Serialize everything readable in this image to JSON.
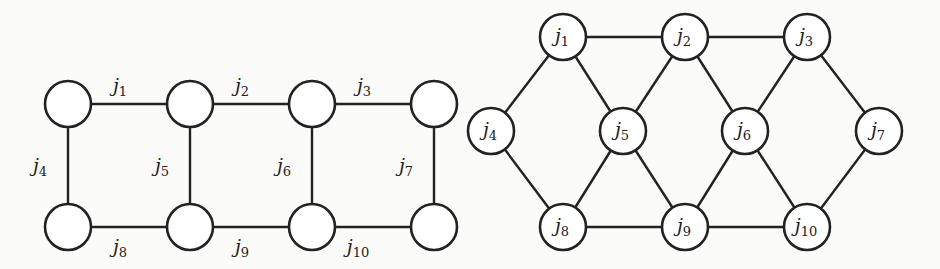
{
  "left_graph": {
    "nodes": [
      {
        "id": "a",
        "x": 68,
        "y": 104
      },
      {
        "id": "b",
        "x": 190,
        "y": 104
      },
      {
        "id": "c",
        "x": 312,
        "y": 104
      },
      {
        "id": "d",
        "x": 434,
        "y": 104
      },
      {
        "id": "e",
        "x": 68,
        "y": 227
      },
      {
        "id": "f",
        "x": 190,
        "y": 227
      },
      {
        "id": "g",
        "x": 312,
        "y": 227
      },
      {
        "id": "h",
        "x": 434,
        "y": 227
      }
    ],
    "edges": [
      {
        "from": "a",
        "to": "b",
        "label": "j",
        "sub": "1",
        "lx": 120,
        "ly": 92
      },
      {
        "from": "b",
        "to": "c",
        "label": "j",
        "sub": "2",
        "lx": 242,
        "ly": 92
      },
      {
        "from": "c",
        "to": "d",
        "label": "j",
        "sub": "3",
        "lx": 364,
        "ly": 92
      },
      {
        "from": "a",
        "to": "e",
        "label": "j",
        "sub": "4",
        "lx": 40,
        "ly": 172
      },
      {
        "from": "b",
        "to": "f",
        "label": "j",
        "sub": "5",
        "lx": 162,
        "ly": 172
      },
      {
        "from": "c",
        "to": "g",
        "label": "j",
        "sub": "6",
        "lx": 284,
        "ly": 172
      },
      {
        "from": "d",
        "to": "h",
        "label": "j",
        "sub": "7",
        "lx": 406,
        "ly": 172
      },
      {
        "from": "e",
        "to": "f",
        "label": "j",
        "sub": "8",
        "lx": 120,
        "ly": 253
      },
      {
        "from": "f",
        "to": "g",
        "label": "j",
        "sub": "9",
        "lx": 242,
        "ly": 253
      },
      {
        "from": "g",
        "to": "h",
        "label": "j",
        "sub": "10",
        "lx": 358,
        "ly": 253
      }
    ]
  },
  "right_graph": {
    "nodes": [
      {
        "id": "j1",
        "label": "j",
        "sub": "1",
        "x": 563,
        "y": 37
      },
      {
        "id": "j2",
        "label": "j",
        "sub": "2",
        "x": 685,
        "y": 37
      },
      {
        "id": "j3",
        "label": "j",
        "sub": "3",
        "x": 807,
        "y": 37
      },
      {
        "id": "j4",
        "label": "j",
        "sub": "4",
        "x": 491,
        "y": 131
      },
      {
        "id": "j5",
        "label": "j",
        "sub": "5",
        "x": 623,
        "y": 131
      },
      {
        "id": "j6",
        "label": "j",
        "sub": "6",
        "x": 745,
        "y": 131
      },
      {
        "id": "j7",
        "label": "j",
        "sub": "7",
        "x": 879,
        "y": 131
      },
      {
        "id": "j8",
        "label": "j",
        "sub": "8",
        "x": 563,
        "y": 227
      },
      {
        "id": "j9",
        "label": "j",
        "sub": "9",
        "x": 685,
        "y": 227
      },
      {
        "id": "j10",
        "label": "j",
        "sub": "10",
        "x": 807,
        "y": 227
      }
    ],
    "edges": [
      [
        "j1",
        "j2"
      ],
      [
        "j2",
        "j3"
      ],
      [
        "j1",
        "j4"
      ],
      [
        "j1",
        "j5"
      ],
      [
        "j2",
        "j5"
      ],
      [
        "j2",
        "j6"
      ],
      [
        "j3",
        "j6"
      ],
      [
        "j3",
        "j7"
      ],
      [
        "j4",
        "j8"
      ],
      [
        "j5",
        "j8"
      ],
      [
        "j5",
        "j9"
      ],
      [
        "j6",
        "j9"
      ],
      [
        "j6",
        "j10"
      ],
      [
        "j7",
        "j10"
      ],
      [
        "j8",
        "j9"
      ],
      [
        "j9",
        "j10"
      ]
    ]
  },
  "style": {
    "node_radius": 23,
    "stroke": "#222222"
  }
}
